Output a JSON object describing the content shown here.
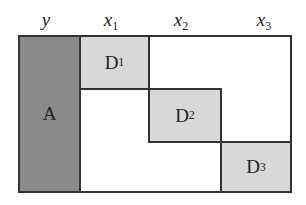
{
  "columns": [
    {
      "var": "y",
      "sub": ""
    },
    {
      "var": "x",
      "sub": "1"
    },
    {
      "var": "x",
      "sub": "2"
    },
    {
      "var": "x",
      "sub": "3"
    }
  ],
  "blocks": {
    "A": {
      "label": "A",
      "sub": "",
      "color": "#8a8a8a"
    },
    "D1": {
      "label": "D",
      "sub": "1",
      "color": "#d8d8d8"
    },
    "D2": {
      "label": "D",
      "sub": "2",
      "color": "#d8d8d8"
    },
    "D3": {
      "label": "D",
      "sub": "3",
      "color": "#d8d8d8"
    }
  }
}
